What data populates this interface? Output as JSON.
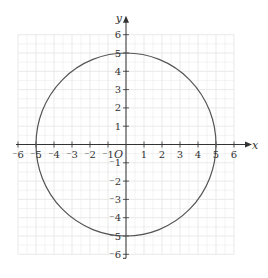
{
  "chart_data": {
    "type": "line",
    "title": "",
    "xlabel": "x",
    "ylabel": "y",
    "origin_label": "O",
    "xlim": [
      -6,
      6
    ],
    "ylim": [
      -6,
      6
    ],
    "grid": true,
    "x_ticks": [
      -6,
      -5,
      -4,
      -3,
      -2,
      -1,
      1,
      2,
      3,
      4,
      5,
      6
    ],
    "y_ticks": [
      -6,
      -5,
      -4,
      -3,
      -2,
      -1,
      1,
      2,
      3,
      4,
      5,
      6
    ],
    "x_tick_labels": [
      "⁻6",
      "⁻5",
      "⁻4",
      "⁻3",
      "⁻2",
      "⁻1",
      "1",
      "2",
      "3",
      "4",
      "5",
      "6"
    ],
    "y_tick_labels": [
      "⁻6",
      "⁻5",
      "⁻4",
      "⁻3",
      "⁻2",
      "⁻1",
      "1",
      "2",
      "3",
      "4",
      "5",
      "6"
    ],
    "series": [
      {
        "name": "circle",
        "shape": "circle",
        "center": [
          0,
          0
        ],
        "radius": 5,
        "equation": "x^2 + y^2 = 25"
      }
    ],
    "colors": {
      "curve": "#555555",
      "axis": "#333333",
      "grid": "#e6e6e6"
    }
  }
}
